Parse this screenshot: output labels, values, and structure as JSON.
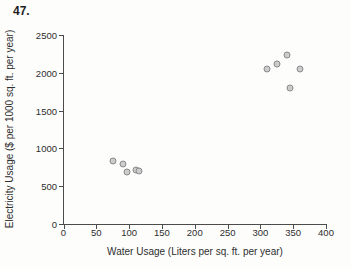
{
  "problem_number": "47.",
  "chart_data": {
    "type": "scatter",
    "title": "",
    "xlabel": "Water Usage (Liters per sq. ft. per year)",
    "ylabel": "Electricity Usage ($ per 1000 sq. ft. per year)",
    "xlim": [
      0,
      400
    ],
    "ylim": [
      0,
      2500
    ],
    "xticks": [
      0,
      50,
      100,
      150,
      200,
      250,
      300,
      350,
      400
    ],
    "yticks": [
      0,
      500,
      1000,
      1500,
      2000,
      2500
    ],
    "grid": false,
    "legend": "none",
    "series": [
      {
        "name": "buildings",
        "points": [
          {
            "x": 75,
            "y": 830
          },
          {
            "x": 90,
            "y": 800
          },
          {
            "x": 97,
            "y": 690
          },
          {
            "x": 110,
            "y": 715
          },
          {
            "x": 115,
            "y": 700
          },
          {
            "x": 310,
            "y": 2050
          },
          {
            "x": 325,
            "y": 2110
          },
          {
            "x": 340,
            "y": 2230
          },
          {
            "x": 345,
            "y": 1800
          },
          {
            "x": 360,
            "y": 2050
          }
        ]
      }
    ],
    "point_fill": "#cccccc",
    "point_stroke": "#8a8a8a",
    "axis_color": "#4c4c4c"
  }
}
